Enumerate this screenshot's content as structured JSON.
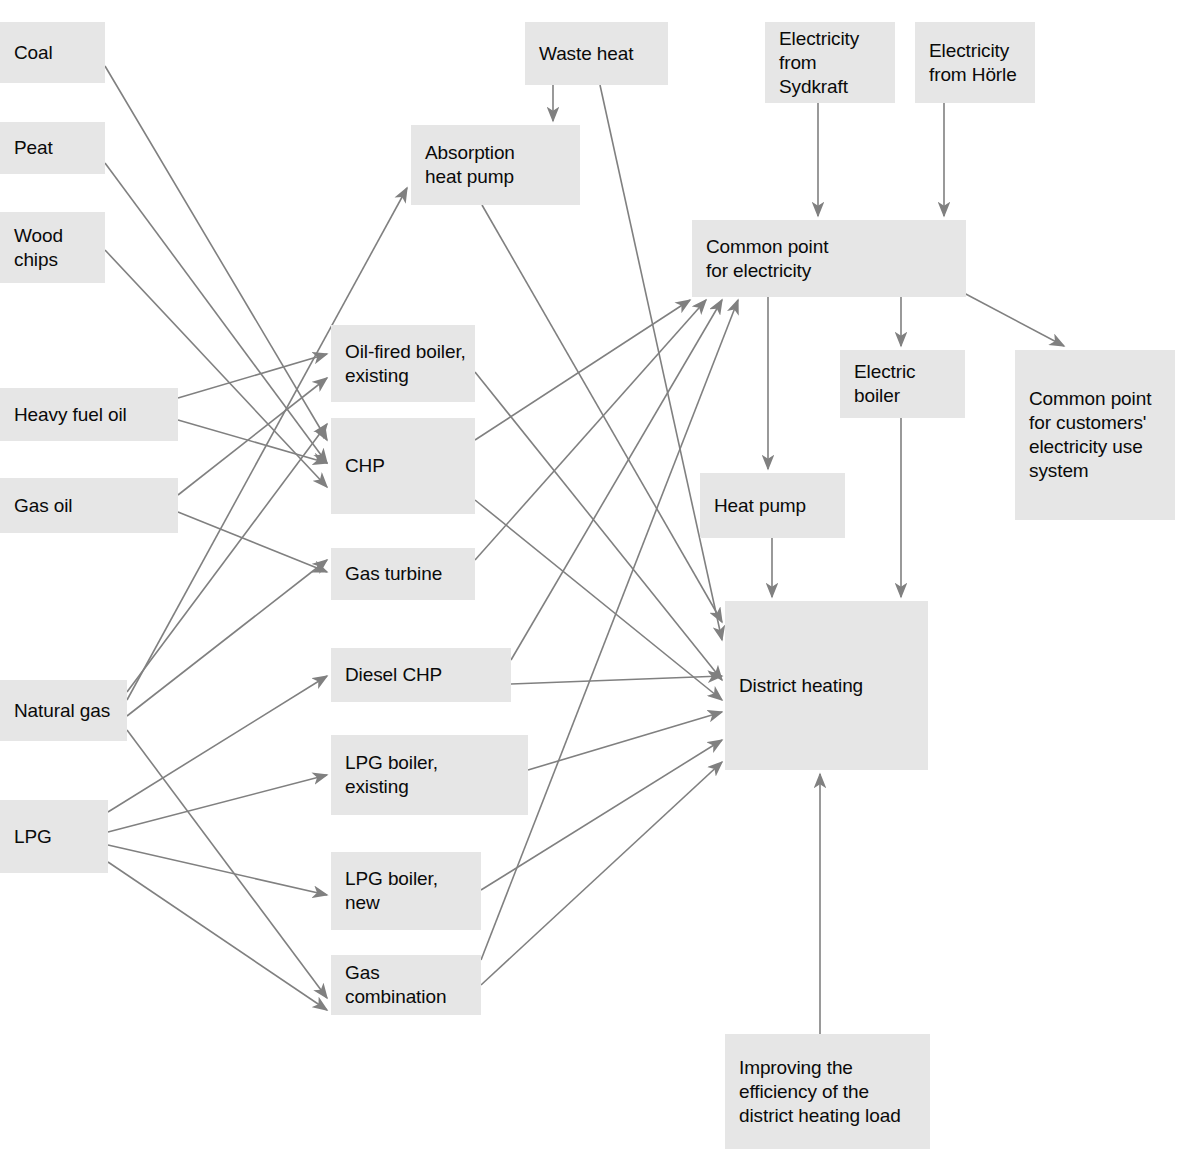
{
  "diagram": {
    "type": "flowchart",
    "canvas": {
      "width": 1184,
      "height": 1155
    },
    "style": {
      "node_fill": "#e6e6e6",
      "node_text": "#0a0a0a",
      "edge_color": "#808080",
      "background": "#ffffff"
    },
    "nodes": [
      {
        "id": "coal",
        "label": "Coal",
        "x": 0,
        "y": 22,
        "w": 105,
        "h": 61
      },
      {
        "id": "peat",
        "label": "Peat",
        "x": 0,
        "y": 122,
        "w": 105,
        "h": 52
      },
      {
        "id": "wood_chips",
        "label": "Wood\nchips",
        "x": 0,
        "y": 212,
        "w": 105,
        "h": 71
      },
      {
        "id": "heavy_fuel_oil",
        "label": "Heavy fuel oil",
        "x": 0,
        "y": 388,
        "w": 178,
        "h": 53
      },
      {
        "id": "gas_oil",
        "label": "Gas oil",
        "x": 0,
        "y": 478,
        "w": 178,
        "h": 55
      },
      {
        "id": "natural_gas",
        "label": "Natural gas",
        "x": 0,
        "y": 680,
        "w": 127,
        "h": 61
      },
      {
        "id": "lpg",
        "label": "LPG",
        "x": 0,
        "y": 800,
        "w": 108,
        "h": 73
      },
      {
        "id": "waste_heat",
        "label": "Waste heat",
        "x": 525,
        "y": 22,
        "w": 143,
        "h": 63
      },
      {
        "id": "absorption_hp",
        "label": "Absorption\nheat pump",
        "x": 411,
        "y": 125,
        "w": 169,
        "h": 80
      },
      {
        "id": "oil_boiler_ex",
        "label": "Oil-fired boiler,\nexisting",
        "x": 331,
        "y": 325,
        "w": 144,
        "h": 77
      },
      {
        "id": "chp",
        "label": "CHP",
        "x": 331,
        "y": 418,
        "w": 144,
        "h": 96
      },
      {
        "id": "gas_turbine",
        "label": "Gas turbine",
        "x": 331,
        "y": 548,
        "w": 144,
        "h": 52
      },
      {
        "id": "diesel_chp",
        "label": "Diesel CHP",
        "x": 331,
        "y": 648,
        "w": 180,
        "h": 54
      },
      {
        "id": "lpg_boiler_ex",
        "label": "LPG boiler,\nexisting",
        "x": 331,
        "y": 735,
        "w": 197,
        "h": 80
      },
      {
        "id": "lpg_boiler_new",
        "label": "LPG boiler,\nnew",
        "x": 331,
        "y": 852,
        "w": 150,
        "h": 78
      },
      {
        "id": "gas_combination",
        "label": "Gas\ncombination",
        "x": 331,
        "y": 955,
        "w": 150,
        "h": 60
      },
      {
        "id": "elec_sydkraft",
        "label": "Electricity\nfrom\nSydkraft",
        "x": 765,
        "y": 22,
        "w": 130,
        "h": 81
      },
      {
        "id": "elec_horle",
        "label": "Electricity\nfrom Hörle",
        "x": 915,
        "y": 22,
        "w": 120,
        "h": 81
      },
      {
        "id": "common_elec",
        "label": "Common point\nfor electricity",
        "x": 692,
        "y": 220,
        "w": 274,
        "h": 77
      },
      {
        "id": "electric_boiler",
        "label": "Electric\nboiler",
        "x": 840,
        "y": 350,
        "w": 125,
        "h": 68
      },
      {
        "id": "common_cust",
        "label": "Common point\nfor customers'\nelectricity use\nsystem",
        "x": 1015,
        "y": 350,
        "w": 160,
        "h": 170
      },
      {
        "id": "heat_pump",
        "label": "Heat pump",
        "x": 700,
        "y": 473,
        "w": 145,
        "h": 65
      },
      {
        "id": "district_heating",
        "label": "District heating",
        "x": 725,
        "y": 601,
        "w": 203,
        "h": 169
      },
      {
        "id": "improving_eff",
        "label": "Improving the\nefficiency of the\ndistrict heating load",
        "x": 725,
        "y": 1034,
        "w": 205,
        "h": 115
      }
    ],
    "edges": [
      {
        "from": "coal",
        "to": "chp",
        "x1": 105,
        "y1": 66,
        "x2": 327,
        "y2": 440
      },
      {
        "from": "peat",
        "to": "chp",
        "x1": 105,
        "y1": 163,
        "x2": 327,
        "y2": 463
      },
      {
        "from": "wood_chips",
        "to": "chp",
        "x1": 105,
        "y1": 250,
        "x2": 327,
        "y2": 487
      },
      {
        "from": "heavy_fuel_oil",
        "to": "oil_boiler_ex",
        "x1": 178,
        "y1": 398,
        "x2": 327,
        "y2": 354
      },
      {
        "from": "heavy_fuel_oil",
        "to": "chp",
        "x1": 178,
        "y1": 420,
        "x2": 327,
        "y2": 463
      },
      {
        "from": "gas_oil",
        "to": "oil_boiler_ex",
        "x1": 178,
        "y1": 495,
        "x2": 327,
        "y2": 378
      },
      {
        "from": "gas_oil",
        "to": "gas_turbine",
        "x1": 178,
        "y1": 512,
        "x2": 327,
        "y2": 572
      },
      {
        "from": "natural_gas",
        "to": "absorption_hp",
        "x1": 127,
        "y1": 700,
        "x2": 407,
        "y2": 188
      },
      {
        "from": "natural_gas",
        "to": "chp",
        "x1": 127,
        "y1": 692,
        "x2": 327,
        "y2": 424
      },
      {
        "from": "natural_gas",
        "to": "gas_turbine",
        "x1": 127,
        "y1": 716,
        "x2": 327,
        "y2": 560
      },
      {
        "from": "natural_gas",
        "to": "gas_combination",
        "x1": 127,
        "y1": 730,
        "x2": 327,
        "y2": 998
      },
      {
        "from": "lpg",
        "to": "diesel_chp",
        "x1": 108,
        "y1": 812,
        "x2": 327,
        "y2": 676
      },
      {
        "from": "lpg",
        "to": "lpg_boiler_ex",
        "x1": 108,
        "y1": 832,
        "x2": 327,
        "y2": 775
      },
      {
        "from": "lpg",
        "to": "lpg_boiler_new",
        "x1": 108,
        "y1": 845,
        "x2": 327,
        "y2": 895
      },
      {
        "from": "lpg",
        "to": "gas_combination",
        "x1": 108,
        "y1": 862,
        "x2": 327,
        "y2": 1010
      },
      {
        "from": "waste_heat",
        "to": "absorption_hp",
        "x1": 553,
        "y1": 85,
        "x2": 553,
        "y2": 121
      },
      {
        "from": "waste_heat",
        "to": "district_heating",
        "x1": 600,
        "y1": 85,
        "x2": 722,
        "y2": 640
      },
      {
        "from": "absorption_hp",
        "to": "district_heating",
        "x1": 482,
        "y1": 205,
        "x2": 722,
        "y2": 622
      },
      {
        "from": "oil_boiler_ex",
        "to": "district_heating",
        "x1": 475,
        "y1": 372,
        "x2": 722,
        "y2": 680
      },
      {
        "from": "chp",
        "to": "common_elec",
        "x1": 475,
        "y1": 440,
        "x2": 690,
        "y2": 300
      },
      {
        "from": "chp",
        "to": "district_heating",
        "x1": 475,
        "y1": 500,
        "x2": 722,
        "y2": 700
      },
      {
        "from": "gas_turbine",
        "to": "common_elec",
        "x1": 475,
        "y1": 560,
        "x2": 706,
        "y2": 300
      },
      {
        "from": "diesel_chp",
        "to": "common_elec",
        "x1": 511,
        "y1": 660,
        "x2": 722,
        "y2": 300
      },
      {
        "from": "diesel_chp",
        "to": "district_heating",
        "x1": 511,
        "y1": 684,
        "x2": 722,
        "y2": 676
      },
      {
        "from": "lpg_boiler_ex",
        "to": "district_heating",
        "x1": 528,
        "y1": 770,
        "x2": 722,
        "y2": 712
      },
      {
        "from": "lpg_boiler_new",
        "to": "district_heating",
        "x1": 481,
        "y1": 890,
        "x2": 722,
        "y2": 740
      },
      {
        "from": "gas_combination",
        "to": "common_elec",
        "x1": 481,
        "y1": 960,
        "x2": 738,
        "y2": 300
      },
      {
        "from": "gas_combination",
        "to": "district_heating",
        "x1": 481,
        "y1": 985,
        "x2": 722,
        "y2": 762
      },
      {
        "from": "elec_sydkraft",
        "to": "common_elec",
        "x1": 818,
        "y1": 103,
        "x2": 818,
        "y2": 216
      },
      {
        "from": "elec_horle",
        "to": "common_elec",
        "x1": 944,
        "y1": 103,
        "x2": 944,
        "y2": 216
      },
      {
        "from": "common_elec",
        "to": "heat_pump",
        "x1": 768,
        "y1": 297,
        "x2": 768,
        "y2": 469
      },
      {
        "from": "common_elec",
        "to": "electric_boiler",
        "x1": 901,
        "y1": 297,
        "x2": 901,
        "y2": 346
      },
      {
        "from": "common_elec",
        "to": "common_cust",
        "x1": 962,
        "y1": 292,
        "x2": 1064,
        "y2": 346
      },
      {
        "from": "heat_pump",
        "to": "district_heating",
        "x1": 772,
        "y1": 538,
        "x2": 772,
        "y2": 597
      },
      {
        "from": "electric_boiler",
        "to": "district_heating",
        "x1": 901,
        "y1": 418,
        "x2": 901,
        "y2": 597
      },
      {
        "from": "improving_eff",
        "to": "district_heating",
        "x1": 820,
        "y1": 1034,
        "x2": 820,
        "y2": 774
      }
    ]
  }
}
